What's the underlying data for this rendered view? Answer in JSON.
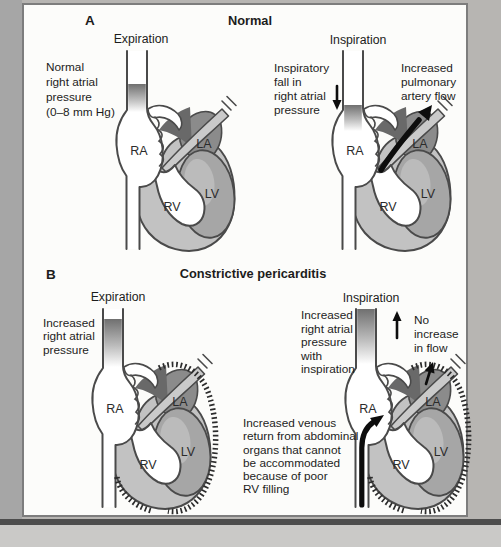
{
  "figure": {
    "panel_a": {
      "label": "A",
      "title": "Normal",
      "expiration": {
        "phase_label": "Expiration",
        "annotation": "Normal\nright atrial\npressure\n(0–8 mm Hg)"
      },
      "inspiration": {
        "phase_label": "Inspiration",
        "annotation_pressure": "Inspiratory\nfall in\nright atrial\npressure",
        "annotation_flow": "Increased\npulmonary\nartery flow"
      }
    },
    "panel_b": {
      "label": "B",
      "title": "Constrictive pericarditis",
      "expiration": {
        "phase_label": "Expiration",
        "annotation": "Increased\nright atrial\npressure"
      },
      "inspiration": {
        "phase_label": "Inspiration",
        "annotation_pressure": "Increased\nright atrial\npressure\nwith\ninspiration",
        "annotation_flow": "No\nincrease\nin flow",
        "annotation_venous": "Increased venous\nreturn from abdominal\norgans that cannot\nbe accommodated\nbecause of poor\nRV filling"
      }
    },
    "chambers": {
      "ra": "RA",
      "rv": "RV",
      "la": "LA",
      "lv": "LV"
    }
  },
  "colors": {
    "ink": "#4a4a4a",
    "text": "#1c1c1c",
    "panel-bg": "#fcfcfa",
    "panel-border": "#7d7d7d",
    "bg-left": "#a6a6a6",
    "bg-right": "#b7b5b2",
    "bg-bottom": "#cac9c7",
    "rule": "#4d4d4d",
    "lv-fill": "#a6a6a6",
    "lv-highlight": "#c2c2c2",
    "la-fill": "#8b8b8b",
    "shadow-fill": "#696969",
    "wall-fill": "#c2c2c2",
    "vessel-fill": "#cacaca",
    "blood": "#686868",
    "arrow": "#0d0d0d",
    "hatch": "#2c2c2c"
  }
}
